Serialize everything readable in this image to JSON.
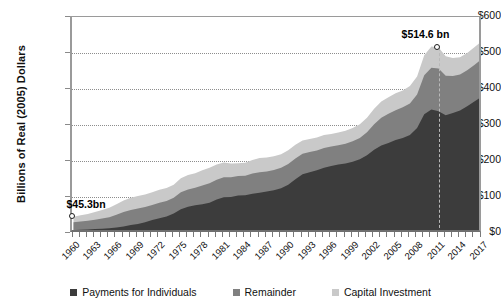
{
  "chart_data": {
    "type": "area",
    "stacked": true,
    "title": "",
    "xlabel": "",
    "ylabel": "Billions of Real (2005) Dollars",
    "ylim": [
      0,
      600
    ],
    "ytick_labels": [
      "$0",
      "$100",
      "$200",
      "$300",
      "$400",
      "$500",
      "$600"
    ],
    "ytick_values": [
      0,
      100,
      200,
      300,
      400,
      500,
      600
    ],
    "grid": true,
    "legend_position": "bottom",
    "x": [
      1960,
      1961,
      1962,
      1963,
      1964,
      1965,
      1966,
      1967,
      1968,
      1969,
      1970,
      1971,
      1972,
      1973,
      1974,
      1975,
      1976,
      1977,
      1978,
      1979,
      1980,
      1981,
      1982,
      1983,
      1984,
      1985,
      1986,
      1987,
      1988,
      1989,
      1990,
      1991,
      1992,
      1993,
      1994,
      1995,
      1996,
      1997,
      1998,
      1999,
      2000,
      2001,
      2002,
      2003,
      2004,
      2005,
      2006,
      2007,
      2008,
      2009,
      2010,
      2011,
      2012,
      2013,
      2014,
      2015,
      2016,
      2017
    ],
    "xtick_labels": [
      "1960",
      "1963",
      "1966",
      "1969",
      "1972",
      "1975",
      "1978",
      "1981",
      "1984",
      "1987",
      "1990",
      "1993",
      "1996",
      "1999",
      "2002",
      "2005",
      "2008",
      "2011",
      "2014",
      "2017"
    ],
    "series": [
      {
        "name": "Payments for Individuals",
        "color": "#3c3c3c",
        "values": [
          8,
          9,
          10,
          11,
          12,
          13,
          15,
          18,
          22,
          25,
          30,
          36,
          41,
          46,
          54,
          66,
          73,
          77,
          80,
          84,
          93,
          99,
          100,
          104,
          105,
          109,
          112,
          115,
          119,
          124,
          134,
          149,
          163,
          169,
          174,
          181,
          186,
          190,
          193,
          198,
          205,
          216,
          231,
          243,
          250,
          258,
          264,
          272,
          292,
          330,
          343,
          338,
          327,
          333,
          340,
          352,
          365,
          378
        ]
      },
      {
        "name": "Remainder",
        "color": "#808080",
        "values": [
          22,
          23,
          24,
          26,
          28,
          31,
          36,
          40,
          42,
          43,
          42,
          42,
          43,
          43,
          44,
          47,
          48,
          49,
          52,
          54,
          55,
          56,
          55,
          54,
          54,
          56,
          57,
          56,
          56,
          57,
          58,
          58,
          57,
          56,
          55,
          55,
          54,
          54,
          55,
          57,
          59,
          64,
          71,
          77,
          81,
          83,
          85,
          88,
          93,
          108,
          116,
          119,
          110,
          103,
          100,
          100,
          102,
          104
        ]
      },
      {
        "name": "Capital Investment",
        "color": "#c9c9c9",
        "values": [
          15,
          17,
          19,
          21,
          24,
          26,
          29,
          32,
          34,
          35,
          35,
          35,
          36,
          36,
          36,
          39,
          40,
          40,
          42,
          43,
          42,
          41,
          38,
          36,
          36,
          38,
          39,
          39,
          38,
          38,
          38,
          38,
          37,
          36,
          36,
          36,
          35,
          35,
          36,
          37,
          38,
          40,
          43,
          45,
          46,
          47,
          47,
          48,
          50,
          56,
          59,
          58,
          54,
          50,
          48,
          48,
          49,
          50
        ]
      }
    ],
    "annotations": [
      {
        "id": "start-annotation",
        "label": "$45.3bn",
        "year": 1960,
        "value": 45.3
      },
      {
        "id": "peak-annotation",
        "label": "$514.6 bn",
        "year": 2011,
        "value": 514.6
      }
    ]
  },
  "legend": {
    "items": [
      {
        "label": "Payments for Individuals",
        "color": "#3c3c3c"
      },
      {
        "label": "Remainder",
        "color": "#808080"
      },
      {
        "label": "Capital Investment",
        "color": "#c9c9c9"
      }
    ]
  }
}
